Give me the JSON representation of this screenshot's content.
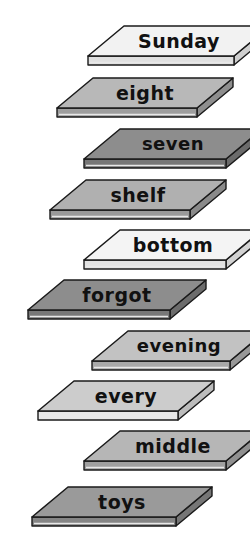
{
  "illustration": {
    "title": "Word slabs staircase",
    "description": "Ten isometric three-dimensional slabs arranged in a descending staircase, each labelled with one word.",
    "background_color": "#ffffff",
    "outline_color": "#1a1a1a",
    "text_color": "#111111",
    "palette": {
      "near_white": "#f2f2f2",
      "light_gray": "#d9d9d9",
      "medium_gray": "#b5b5b5",
      "dark_gray": "#8d8d8d",
      "side_shadow": "#6f6f6f",
      "edge_light": "#e8e8e8"
    },
    "slabs": [
      {
        "index": 1,
        "word": "Sunday",
        "top_color": "#f2f2f2",
        "front_color": "#e0e0e0",
        "side_color": "#cfcfcf",
        "shade_name": "near-white",
        "x": 88,
        "y": 26,
        "width": 146,
        "font_size": 19
      },
      {
        "index": 2,
        "word": "eight",
        "top_color": "#b8b8b8",
        "front_color": "#9e9e9e",
        "side_color": "#8e8e8e",
        "shade_name": "medium-gray",
        "x": 57,
        "y": 78,
        "width": 140,
        "font_size": 19
      },
      {
        "index": 3,
        "word": "seven",
        "top_color": "#8d8d8d",
        "front_color": "#777777",
        "side_color": "#6b6b6b",
        "shade_name": "dark-gray",
        "x": 84,
        "y": 129,
        "width": 142,
        "font_size": 18
      },
      {
        "index": 4,
        "word": "shelf",
        "top_color": "#b0b0b0",
        "front_color": "#9a9a9a",
        "side_color": "#8a8a8a",
        "shade_name": "medium-gray",
        "x": 50,
        "y": 180,
        "width": 140,
        "font_size": 19
      },
      {
        "index": 5,
        "word": "bottom",
        "top_color": "#f4f4f4",
        "front_color": "#e2e2e2",
        "side_color": "#d2d2d2",
        "shade_name": "near-white",
        "x": 84,
        "y": 230,
        "width": 142,
        "font_size": 19
      },
      {
        "index": 6,
        "word": "forgot",
        "top_color": "#8d8d8d",
        "front_color": "#787878",
        "side_color": "#6c6c6c",
        "shade_name": "dark-gray",
        "x": 28,
        "y": 280,
        "width": 142,
        "font_size": 19
      },
      {
        "index": 7,
        "word": "evening",
        "top_color": "#c2c2c2",
        "front_color": "#a9a9a9",
        "side_color": "#989898",
        "shade_name": "light-gray",
        "x": 92,
        "y": 331,
        "width": 138,
        "font_size": 18
      },
      {
        "index": 8,
        "word": "every",
        "top_color": "#cccccc",
        "front_color": "#e8e8e8",
        "side_color": "#bcbcbc",
        "shade_name": "light-gray",
        "x": 38,
        "y": 381,
        "width": 140,
        "font_size": 19
      },
      {
        "index": 9,
        "word": "middle",
        "top_color": "#b6b6b6",
        "front_color": "#a0a0a0",
        "side_color": "#909090",
        "shade_name": "medium-gray",
        "x": 84,
        "y": 431,
        "width": 142,
        "font_size": 19
      },
      {
        "index": 10,
        "word": "toys",
        "top_color": "#9a9a9a",
        "front_color": "#858585",
        "side_color": "#767676",
        "shade_name": "dark-gray",
        "x": 32,
        "y": 487,
        "width": 144,
        "font_size": 19
      }
    ],
    "geometry": {
      "skew_x": 36,
      "top_height": 30,
      "thickness": 9
    }
  }
}
